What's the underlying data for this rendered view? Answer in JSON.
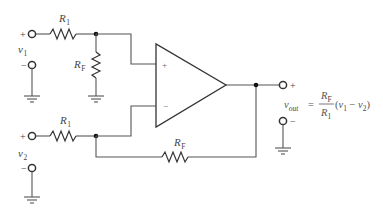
{
  "diagram": {
    "type": "op-amp difference amplifier",
    "components": {
      "r1_top": {
        "label": "R",
        "sub": "1"
      },
      "rf_shunt": {
        "label": "R",
        "sub": "F"
      },
      "r1_bottom": {
        "label": "R",
        "sub": "1"
      },
      "rf_feedback": {
        "label": "R",
        "sub": "F"
      }
    },
    "inputs": {
      "v1": {
        "label": "v",
        "sub": "1",
        "plus": "+",
        "minus": "−"
      },
      "v2": {
        "label": "v",
        "sub": "2",
        "plus": "+",
        "minus": "−"
      }
    },
    "opamp": {
      "noninverting": "+",
      "inverting": "−"
    },
    "output": {
      "plus": "+",
      "minus": "−",
      "lhs_var": "v",
      "lhs_sub": "out",
      "equals": "=",
      "num_var": "R",
      "num_sub": "F",
      "den_var": "R",
      "den_sub": "1",
      "paren_open": "(",
      "term1_var": "v",
      "term1_sub": "1",
      "op": " − ",
      "term2_var": "v",
      "term2_sub": "2",
      "paren_close": ")"
    }
  }
}
